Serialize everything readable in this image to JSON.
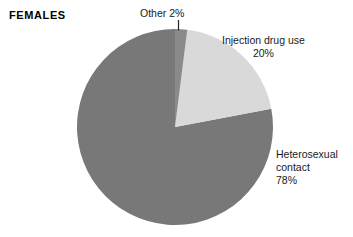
{
  "chart_title": "FEMALES",
  "chart_data": {
    "type": "pie",
    "title": "FEMALES",
    "categories": [
      "Other",
      "Injection drug use",
      "Heterosexual contact"
    ],
    "values": [
      2,
      20,
      78
    ],
    "value_unit": "percent",
    "start_angle_deg": 0,
    "direction": "clockwise",
    "legend": "none",
    "labels": [
      {
        "name": "Other",
        "line1": "Other 2%",
        "percent": "2%",
        "color": "#8a8a8a",
        "leader_line": true
      },
      {
        "name": "Injection drug use",
        "line1": "Injection drug use",
        "percent": "20%",
        "color": "#d9d9d9",
        "leader_line": false
      },
      {
        "name": "Heterosexual contact",
        "line1": "Heterosexual",
        "line2": "contact",
        "percent": "78%",
        "color": "#787878",
        "leader_line": false
      }
    ],
    "colors": {
      "other": "#8a8a8a",
      "injection_drug_use": "#d9d9d9",
      "heterosexual_contact": "#787878",
      "background": "#ffffff",
      "text": "#1a1a1a",
      "leader_line": "#222222"
    },
    "geometry": {
      "center_x": 175,
      "center_y": 127,
      "radius": 98
    }
  }
}
